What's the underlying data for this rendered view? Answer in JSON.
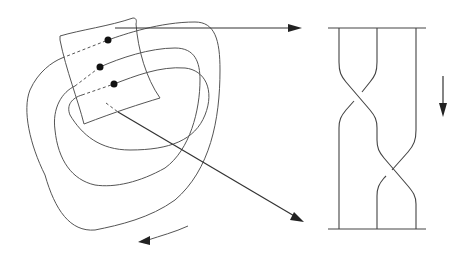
{
  "diagram": {
    "colors": {
      "background": "#ffffff",
      "stroke": "#555555",
      "arrow": "#333333",
      "dot": "#111111"
    },
    "left": {
      "loops": 3,
      "points": [
        {
          "x": 108,
          "y": 40
        },
        {
          "x": 100,
          "y": 67
        },
        {
          "x": 114,
          "y": 84
        }
      ],
      "rotation_arrow": "counterclockwise-arrow"
    },
    "mapping_arrows": [
      {
        "from": [
          115,
          28
        ],
        "to": [
          300,
          28
        ],
        "label": ""
      },
      {
        "from": [
          118,
          112
        ],
        "to": [
          303,
          221
        ],
        "label": ""
      }
    ],
    "right": {
      "strands": 3,
      "top_bar_y": 28,
      "bottom_bar_y": 229,
      "crossings": [
        {
          "between": [
            1,
            2
          ],
          "y": 90
        },
        {
          "between": [
            2,
            3
          ],
          "y": 167
        }
      ],
      "direction_arrow": "down-arrow"
    }
  }
}
